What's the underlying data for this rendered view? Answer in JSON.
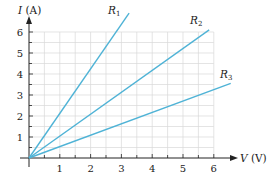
{
  "chart_data": {
    "type": "line",
    "title": "",
    "xlabel": "V (V)",
    "ylabel": "I (A)",
    "xlabel_var": "V",
    "xlabel_unit": "(V)",
    "ylabel_var": "I",
    "ylabel_unit": "(A)",
    "xlim": [
      0,
      6
    ],
    "ylim": [
      0,
      6
    ],
    "x_ticks": [
      1,
      2,
      3,
      4,
      5,
      6
    ],
    "y_ticks": [
      1,
      2,
      3,
      4,
      5,
      6
    ],
    "grid": true,
    "grid_step": 0.5,
    "line_color": "#4fb3d6",
    "series": [
      {
        "name": "R1",
        "letter": "R",
        "subscript": "1",
        "x": [
          0,
          3.25
        ],
        "y": [
          0,
          6.9
        ]
      },
      {
        "name": "R2",
        "letter": "R",
        "subscript": "2",
        "x": [
          0,
          5.85
        ],
        "y": [
          0,
          6.1
        ]
      },
      {
        "name": "R3",
        "letter": "R",
        "subscript": "3",
        "x": [
          0,
          6.55
        ],
        "y": [
          0,
          3.55
        ]
      }
    ]
  }
}
